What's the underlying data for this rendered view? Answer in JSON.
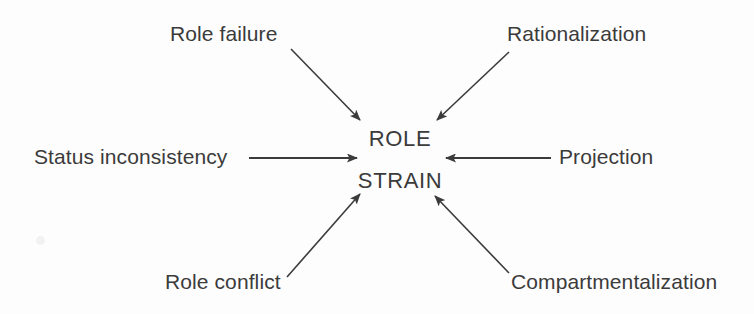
{
  "diagram": {
    "type": "radial-hub",
    "title": "Role Strain",
    "background_color": "#fdfdfd",
    "ink_color": "#3b3b3b",
    "center": {
      "line1": "ROLE",
      "line2": "STRAIN"
    },
    "nodes": [
      {
        "id": "role-failure",
        "label": "Role failure",
        "position": "top-left",
        "arrow_direction": "down-right"
      },
      {
        "id": "rationalization",
        "label": "Rationalization",
        "position": "top-right",
        "arrow_direction": "down-left"
      },
      {
        "id": "status-inconsistency",
        "label": "Status inconsistency",
        "position": "left",
        "arrow_direction": "right"
      },
      {
        "id": "projection",
        "label": "Projection",
        "position": "right",
        "arrow_direction": "left"
      },
      {
        "id": "role-conflict",
        "label": "Role conflict",
        "position": "bottom-left",
        "arrow_direction": "up-right"
      },
      {
        "id": "compartmentalization",
        "label": "Compartmentalization",
        "position": "bottom-right",
        "arrow_direction": "up-left"
      }
    ]
  }
}
